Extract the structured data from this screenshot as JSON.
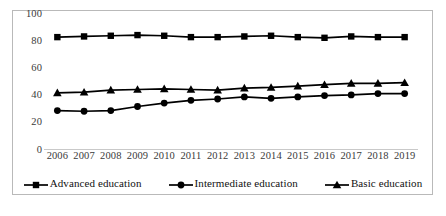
{
  "chart_data": {
    "type": "line",
    "title": "",
    "subtitle": "",
    "xlabel": "",
    "ylabel": "",
    "categories": [
      "2006",
      "2007",
      "2008",
      "2009",
      "2010",
      "2011",
      "2012",
      "2013",
      "2014",
      "2015",
      "2016",
      "2017",
      "2018",
      "2019"
    ],
    "ylim": [
      0,
      100
    ],
    "yticks": [
      0,
      20,
      40,
      60,
      80,
      100
    ],
    "ytick_labels": [
      "0",
      "20",
      "40",
      "60",
      "80",
      "100"
    ],
    "grid": false,
    "legend_position": "bottom",
    "series": [
      {
        "name": "Advanced education",
        "marker": "square",
        "color": "#000000",
        "values": [
          83,
          83.5,
          84,
          84.5,
          84,
          83,
          83,
          83.5,
          84,
          83,
          82.5,
          83.5,
          83,
          83
        ]
      },
      {
        "name": "Intermediate education",
        "marker": "circle",
        "color": "#000000",
        "values": [
          29,
          28.5,
          29,
          32,
          34.5,
          36.5,
          37.5,
          39,
          38,
          39,
          40,
          40.5,
          41.5,
          41.5
        ]
      },
      {
        "name": "Basic education",
        "marker": "triangle",
        "color": "#000000",
        "values": [
          42,
          42.5,
          44,
          44.5,
          45,
          44.5,
          44,
          45.5,
          46,
          47,
          48,
          49,
          49,
          49.5
        ]
      }
    ]
  },
  "legend": {
    "items": [
      {
        "label": "Advanced education",
        "marker": "square"
      },
      {
        "label": "Intermediate education",
        "marker": "circle"
      },
      {
        "label": "Basic education",
        "marker": "triangle"
      }
    ]
  },
  "colors": {
    "line": "#000000",
    "frame": "#b9b9b9",
    "tick_text": "#3a3a3a",
    "background": "#ffffff"
  }
}
